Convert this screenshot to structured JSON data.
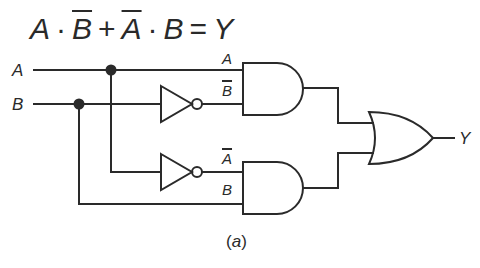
{
  "equation": {
    "term1_a": "A",
    "dot1": "·",
    "term1_b": "B",
    "plus": "+",
    "term2_a": "A",
    "dot2": "·",
    "term2_b": "B",
    "equals": "=",
    "output": "Y"
  },
  "inputs": {
    "a_label": "A",
    "b_label": "B"
  },
  "gates": {
    "and1": {
      "type": "AND",
      "in1_label": "A",
      "in2_label": "B",
      "in2_inverted": true
    },
    "and2": {
      "type": "AND",
      "in1_label": "A",
      "in1_inverted": true,
      "in2_label": "B"
    },
    "not1": {
      "type": "NOT",
      "input": "B"
    },
    "not2": {
      "type": "NOT",
      "input": "A"
    },
    "or1": {
      "type": "OR",
      "output_label": "Y"
    }
  },
  "caption": {
    "open": "(",
    "letter": "a",
    "close": ")"
  },
  "colors": {
    "stroke": "#2a2a2a",
    "background": "#ffffff"
  }
}
